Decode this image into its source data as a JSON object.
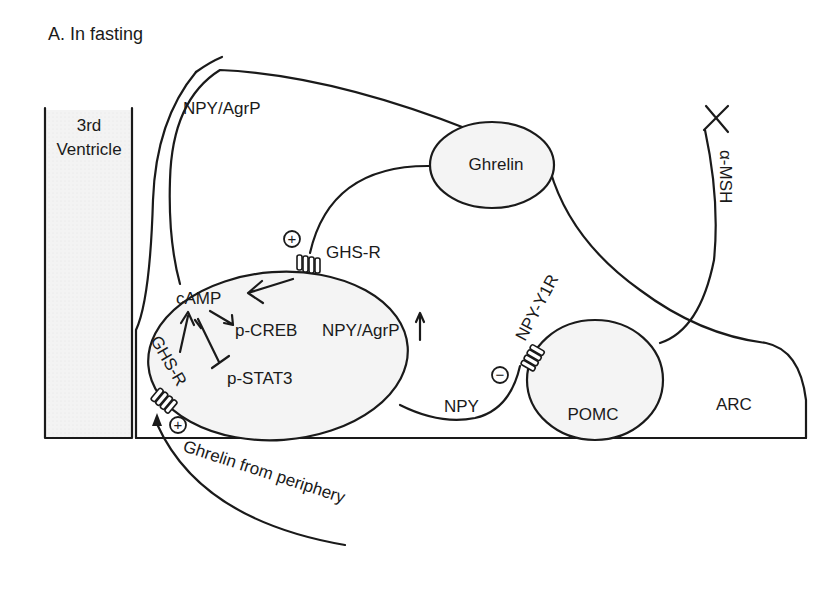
{
  "title": "A. In fasting",
  "regions": {
    "ventricle_line1": "3rd",
    "ventricle_line2": "Ventricle",
    "arc": "ARC"
  },
  "neurons": {
    "npy_agrp_axon_label": "NPY/AgrP",
    "ghrelin": "Ghrelin",
    "pomc": "POMC",
    "alpha_msh": "α-MSH"
  },
  "signaling": {
    "camp": "cAMP",
    "p_creb": "p-CREB",
    "npy_agrp_output": "NPY/AgrP",
    "p_stat3": "p-STAT3",
    "npy": "NPY"
  },
  "receptors": {
    "ghs_r_top": "GHS-R",
    "ghs_r_bottom": "GHS-R",
    "npy_y1r": "NPY-Y1R"
  },
  "signs": {
    "ghs_r_top": "+",
    "ghs_r_bottom": "+",
    "npy_y1r": "−"
  },
  "inputs": {
    "peripheral_ghrelin": "Ghrelin from periphery"
  }
}
